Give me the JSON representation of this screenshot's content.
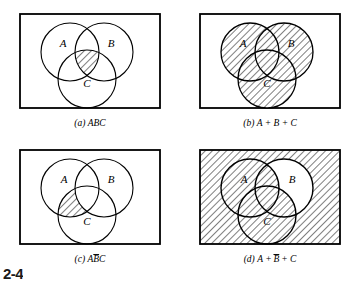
{
  "figure": {
    "number": "2-4",
    "set_labels": {
      "a": "A",
      "b": "B",
      "c": "C"
    },
    "colors": {
      "stroke": "#000000",
      "background": "#ffffff",
      "hatch": "#000000",
      "shade_fill": "#d8d8d8",
      "border": "#000000"
    }
  },
  "panels": [
    {
      "id": "a",
      "tag": "(a)",
      "caption_text": "ABC",
      "caption_full": "(a) ABC",
      "expression": "ABC",
      "shaded_region": "A and B and C (triple intersection)",
      "labels": {
        "a": "A",
        "b": "B",
        "c": "C"
      },
      "shaded_count": 1,
      "circles_filled": false,
      "universe_filled": false
    },
    {
      "id": "b",
      "tag": "(b)",
      "caption_text": "A + B + C",
      "caption_full": "(b) A + B + C",
      "expression": "A + B + C",
      "shaded_region": "union of A, B and C",
      "labels": {
        "a": "A",
        "b": "B",
        "c": "C"
      },
      "shaded_count": 3,
      "circles_filled": true,
      "universe_filled": false
    },
    {
      "id": "c",
      "tag": "(c)",
      "caption_text": "AB̄C",
      "caption_parts": {
        "pre": "A",
        "bar": "B",
        "post": "C"
      },
      "caption_full": "(c) AB̄C",
      "expression": "A B-bar C",
      "shaded_region": "A and C but not B",
      "labels": {
        "a": "A",
        "b": "B",
        "c": "C"
      },
      "shaded_count": 1,
      "circles_filled": false,
      "universe_filled": false
    },
    {
      "id": "d",
      "tag": "(d)",
      "caption_text": "A + B̄ + C",
      "caption_parts": {
        "pre": "A + ",
        "bar": "B",
        "post": " + C"
      },
      "caption_full": "(d) A + B̄ + C",
      "expression": "A + B-bar + C",
      "shaded_region": "everything except B outside A and C",
      "labels": {
        "a": "A",
        "b": "B",
        "c": "C"
      },
      "shaded_count": 1,
      "circles_filled": false,
      "universe_filled": true
    }
  ]
}
